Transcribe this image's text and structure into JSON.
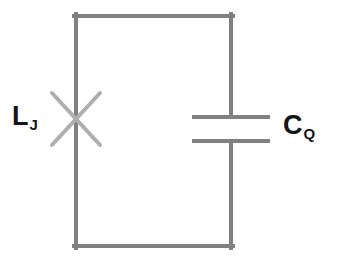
{
  "figure": {
    "kind": "circuit-diagram",
    "background_color": "#ffffff",
    "wire_color": "#808080",
    "junction_color": "#aeaeae",
    "label_color": "#141414",
    "wire_width": 4
  },
  "loop": {
    "name": "circuit-loop",
    "x1": 76,
    "y1": 16,
    "x2": 231,
    "y2": 246
  },
  "components": [
    {
      "id": "josephson-junction",
      "type": "josephson-junction",
      "symbol": "x-cross",
      "branch": "left",
      "center_x": 76,
      "center_y": 119,
      "arm_half_width": 24,
      "arm_half_height": 26,
      "label": {
        "base": "L",
        "subscript": "J"
      }
    },
    {
      "id": "capacitor",
      "type": "capacitor",
      "symbol": "parallel-plates",
      "branch": "right",
      "center_x": 231,
      "plate_x1": 192,
      "plate_x2": 270,
      "plate_top_y": 117,
      "plate_bottom_y": 141,
      "label": {
        "base": "C",
        "subscript": "Q"
      }
    }
  ],
  "labels": {
    "inductor": {
      "base": "L",
      "subscript": "J"
    },
    "capacitor": {
      "base": "C",
      "subscript": "Q"
    }
  }
}
